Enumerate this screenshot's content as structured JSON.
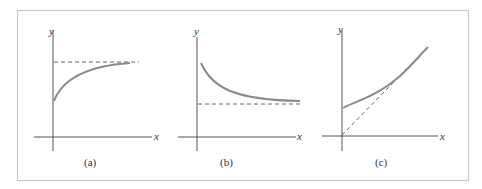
{
  "figure": {
    "frame_color": "#c8c8c8",
    "axis_color": "#555555",
    "curve_color": "#8a8a8a",
    "panels": [
      {
        "label": "(a)",
        "x_axis_label": "x",
        "y_axis_label": "y",
        "description": "Increasing curve starting above origin, approaching horizontal asymptote from below"
      },
      {
        "label": "(b)",
        "x_axis_label": "x",
        "y_axis_label": "y",
        "description": "Decreasing curve approaching horizontal asymptote from above"
      },
      {
        "label": "(c)",
        "x_axis_label": "x",
        "y_axis_label": "y",
        "description": "Curve starting above origin approaching oblique asymptote through origin"
      }
    ]
  }
}
